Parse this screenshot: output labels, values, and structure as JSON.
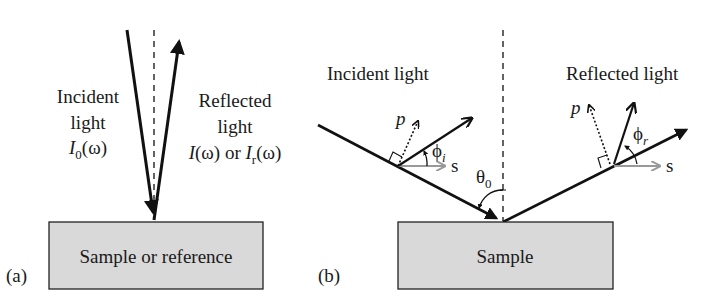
{
  "panel_a": {
    "label": "(a)",
    "incident": {
      "line1": "Incident",
      "line2": "light",
      "symbol": "I",
      "sub": "0",
      "arg": "(ω)"
    },
    "reflected": {
      "line1": "Reflected",
      "line2": "light",
      "sym1": "I",
      "arg1": "(ω) or ",
      "sym2": "I",
      "sub2": "r",
      "arg2": "(ω)"
    },
    "box_label": "Sample or reference"
  },
  "panel_b": {
    "label": "(b)",
    "incident_label": "Incident light",
    "reflected_label": "Reflected light",
    "p_incident": "p",
    "s_incident": "s",
    "phi_incident": "ϕ",
    "phi_incident_sub": "i",
    "theta": "θ",
    "theta_sub": "0",
    "p_reflected": "p",
    "s_reflected": "s",
    "phi_reflected": "ϕ",
    "phi_reflected_sub": "r",
    "box_label": "Sample"
  },
  "colors": {
    "box_fill": "#d9d9d9",
    "line": "#111111",
    "gray_arrow": "#999999"
  }
}
